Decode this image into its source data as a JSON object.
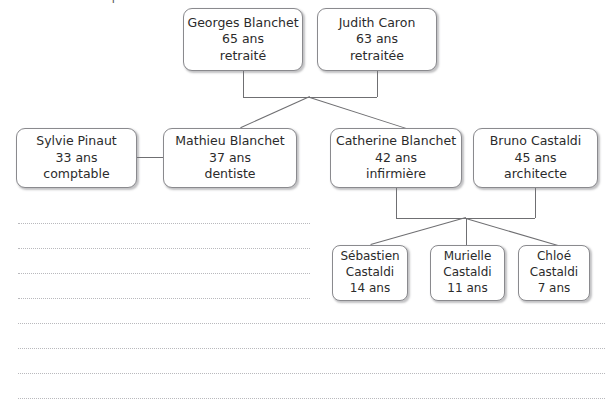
{
  "header": {
    "clipped_text": "famille dans un petit tableau"
  },
  "colors": {
    "box_border": "#8a8a8e",
    "connector": "#6f6f72",
    "rule_dots": "#b9b9bd",
    "text": "#2b2b2b",
    "background": "#ffffff"
  },
  "generations": [
    {
      "id": "grandparents",
      "people": [
        {
          "id": "georges-blanchet",
          "name": "Georges Blanchet",
          "age": "65 ans",
          "occupation": "retraité",
          "x": 183,
          "y": 8,
          "w": 120,
          "h": 63
        },
        {
          "id": "judith-caron",
          "name": "Judith Caron",
          "age": "63 ans",
          "occupation": "retraitée",
          "x": 317,
          "y": 8,
          "w": 120,
          "h": 63
        }
      ]
    },
    {
      "id": "parents",
      "people": [
        {
          "id": "sylvie-pinaut",
          "name": "Sylvie Pinaut",
          "age": "33 ans",
          "occupation": "comptable",
          "x": 16,
          "y": 128,
          "w": 121,
          "h": 60
        },
        {
          "id": "mathieu-blanchet",
          "name": "Mathieu Blanchet",
          "age": "37 ans",
          "occupation": "dentiste",
          "x": 163,
          "y": 128,
          "w": 134,
          "h": 60
        },
        {
          "id": "catherine-blanchet",
          "name": "Catherine Blanchet",
          "age": "42 ans",
          "occupation": "infirmière",
          "x": 330,
          "y": 128,
          "w": 132,
          "h": 60
        },
        {
          "id": "bruno-castaldi",
          "name": "Bruno Castaldi",
          "age": "45 ans",
          "occupation": "architecte",
          "x": 473,
          "y": 128,
          "w": 125,
          "h": 60
        }
      ]
    },
    {
      "id": "children",
      "people": [
        {
          "id": "sebastien-castaldi",
          "name_line1": "Sébastien",
          "name_line2": "Castaldi",
          "age": "14 ans",
          "x": 332,
          "y": 245,
          "w": 76,
          "h": 56
        },
        {
          "id": "murielle-castaldi",
          "name_line1": "Murielle",
          "name_line2": "Castaldi",
          "age": "11 ans",
          "x": 430,
          "y": 245,
          "w": 75,
          "h": 56
        },
        {
          "id": "chloe-castaldi",
          "name_line1": "Chloé",
          "name_line2": "Castaldi",
          "age": "7 ans",
          "x": 518,
          "y": 245,
          "w": 72,
          "h": 56
        }
      ]
    }
  ],
  "ruled_lines": {
    "short_start_x": 18,
    "short_end_x": 310,
    "full_start_x": 18,
    "full_end_x": 605,
    "rows_y": [
      223,
      248,
      273,
      298,
      323,
      348,
      373,
      398
    ]
  }
}
